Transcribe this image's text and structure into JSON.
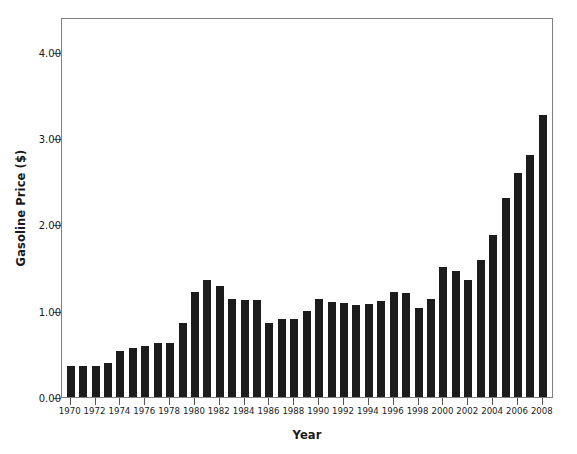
{
  "chart_data": {
    "type": "bar",
    "title": "",
    "xlabel": "Year",
    "ylabel": "Gasoline Price ($)",
    "ylim": [
      0.0,
      4.4
    ],
    "xlim": [
      1969.3,
      2008.9
    ],
    "grid": false,
    "legend": null,
    "bar_color": "#1c1c1c",
    "frame_color": "#808080",
    "ytick_labels": [
      "0.00",
      "1.00",
      "2.00",
      "3.00",
      "4.00"
    ],
    "ytick_values": [
      0.0,
      1.0,
      2.0,
      3.0,
      4.0
    ],
    "xtick_labels": [
      "1970",
      "1972",
      "1974",
      "1976",
      "1978",
      "1980",
      "1982",
      "1984",
      "1986",
      "1988",
      "1990",
      "1992",
      "1994",
      "1996",
      "1998",
      "2000",
      "2002",
      "2004",
      "2006",
      "2008"
    ],
    "xtick_values": [
      1970,
      1972,
      1974,
      1976,
      1978,
      1980,
      1982,
      1984,
      1986,
      1988,
      1990,
      1992,
      1994,
      1996,
      1998,
      2000,
      2002,
      2004,
      2006,
      2008
    ],
    "categories": [
      1970,
      1971,
      1972,
      1973,
      1974,
      1975,
      1976,
      1977,
      1978,
      1979,
      1980,
      1981,
      1982,
      1983,
      1984,
      1985,
      1986,
      1987,
      1988,
      1989,
      1990,
      1991,
      1992,
      1993,
      1994,
      1995,
      1996,
      1997,
      1998,
      1999,
      2000,
      2001,
      2002,
      2003,
      2004,
      2005,
      2006,
      2007,
      2008
    ],
    "values": [
      0.36,
      0.36,
      0.36,
      0.39,
      0.53,
      0.57,
      0.59,
      0.62,
      0.63,
      0.86,
      1.22,
      1.35,
      1.28,
      1.13,
      1.12,
      1.12,
      0.86,
      0.9,
      0.9,
      1.0,
      1.13,
      1.1,
      1.09,
      1.07,
      1.08,
      1.11,
      1.22,
      1.2,
      1.03,
      1.14,
      1.51,
      1.46,
      1.36,
      1.59,
      1.88,
      2.3,
      2.59,
      2.8,
      3.27
    ]
  },
  "axis_titles": {
    "y": "Gasoline Price ($)",
    "x": "Year"
  }
}
